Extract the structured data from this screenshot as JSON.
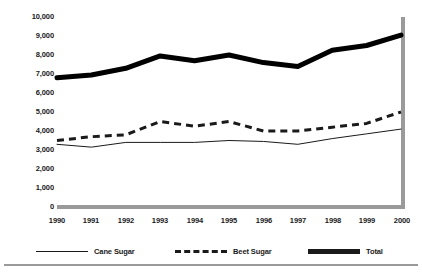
{
  "chart_data": {
    "type": "line",
    "title": "",
    "xlabel": "",
    "ylabel": "",
    "categories": [
      "1990",
      "1991",
      "1992",
      "1993",
      "1994",
      "1995",
      "1996",
      "1997",
      "1998",
      "1999",
      "2000"
    ],
    "x": [
      1990,
      1991,
      1992,
      1993,
      1994,
      1995,
      1996,
      1997,
      1998,
      1999,
      2000
    ],
    "ylim": [
      0,
      10000
    ],
    "ytick_labels": [
      "10,000",
      "9,000",
      "8,000",
      "7,000",
      "6,000",
      "5,000",
      "4,000",
      "3,000",
      "2,000",
      "1,000",
      "0"
    ],
    "ytick_values": [
      10000,
      9000,
      8000,
      7000,
      6000,
      5000,
      4000,
      3000,
      2000,
      1000,
      0
    ],
    "grid": false,
    "legend_position": "bottom",
    "series": [
      {
        "name": "Cane Sugar",
        "style": "thin-solid",
        "color": "#1a1a1a",
        "values": [
          3300,
          3150,
          3400,
          3400,
          3400,
          3500,
          3450,
          3300,
          3600,
          3850,
          4100
        ]
      },
      {
        "name": "Beet Sugar",
        "style": "dashed",
        "color": "#1a1a1a",
        "values": [
          3500,
          3700,
          3800,
          4500,
          4250,
          4500,
          4000,
          4000,
          4200,
          4400,
          5000
        ]
      },
      {
        "name": "Total",
        "style": "thick-solid",
        "color": "#000000",
        "values": [
          6800,
          6950,
          7300,
          7950,
          7700,
          8000,
          7600,
          7400,
          8250,
          8500,
          9050
        ]
      }
    ]
  },
  "axis": {
    "baseline_color": "#9a9a9a",
    "right_border_color": "#9a9a9a"
  },
  "legend": {
    "items": [
      {
        "label": "Cane Sugar",
        "swatch": "thin-line-swatch"
      },
      {
        "label": "Beet Sugar",
        "swatch": "dashed-line-swatch"
      },
      {
        "label": "Total",
        "swatch": "thick-line-swatch"
      }
    ]
  }
}
